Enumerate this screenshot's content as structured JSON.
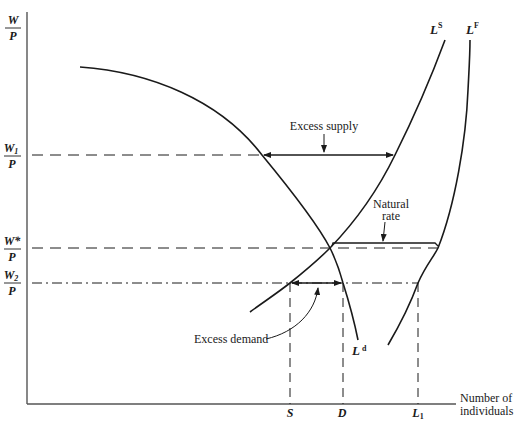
{
  "diagram": {
    "type": "labor-market-diagram",
    "y_axis": {
      "label_num": "W",
      "label_den": "P"
    },
    "x_axis": {
      "label_line1": "Number of",
      "label_line2": "individuals"
    },
    "wage_levels": [
      {
        "id": "w1",
        "num": "W",
        "num_sub": "1",
        "den": "P",
        "line_style": "dashed"
      },
      {
        "id": "wstar",
        "num": "W*",
        "num_sub": "",
        "den": "P",
        "line_style": "dashed"
      },
      {
        "id": "w2",
        "num": "W",
        "num_sub": "2",
        "den": "P",
        "line_style": "dash-dot"
      }
    ],
    "curves": [
      {
        "id": "Ld",
        "label": "L",
        "sup": "d",
        "meaning": "labor demand"
      },
      {
        "id": "Ls",
        "label": "L",
        "sup": "S",
        "meaning": "labor supply"
      },
      {
        "id": "LF",
        "label": "L",
        "sup": "F",
        "meaning": "labor force"
      }
    ],
    "x_ticks": [
      {
        "id": "S",
        "label": "S",
        "sub": ""
      },
      {
        "id": "D",
        "label": "D",
        "sub": ""
      },
      {
        "id": "L1",
        "label": "L",
        "sub": "1"
      }
    ],
    "annotations": {
      "excess_supply": "Excess supply",
      "natural_rate_line1": "Natural",
      "natural_rate_line2": "rate",
      "excess_demand": "Excess demand"
    }
  }
}
